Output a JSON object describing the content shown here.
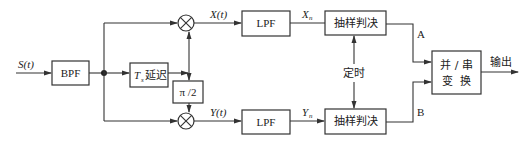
{
  "diagram": {
    "input_label": "S(t)",
    "bpf_label": "BPF",
    "delay_label_ts": "T",
    "delay_label_sub": "s",
    "delay_label_cn": "延迟",
    "phase_shift_label": "π /2",
    "x_signal_label": "X(t)",
    "y_signal_label": "Y(t)",
    "lpf_top_label": "LPF",
    "lpf_bottom_label": "LPF",
    "xn_label": "X",
    "xn_sub": "n",
    "yn_label": "Y",
    "yn_sub": "n",
    "sampler_top_label": "抽样判决",
    "sampler_bottom_label": "抽样判决",
    "timing_label": "定时",
    "branch_a_label": "A",
    "branch_b_label": "B",
    "converter_line1": "并 / 串",
    "converter_line2": "变  换",
    "output_label": "输出"
  }
}
